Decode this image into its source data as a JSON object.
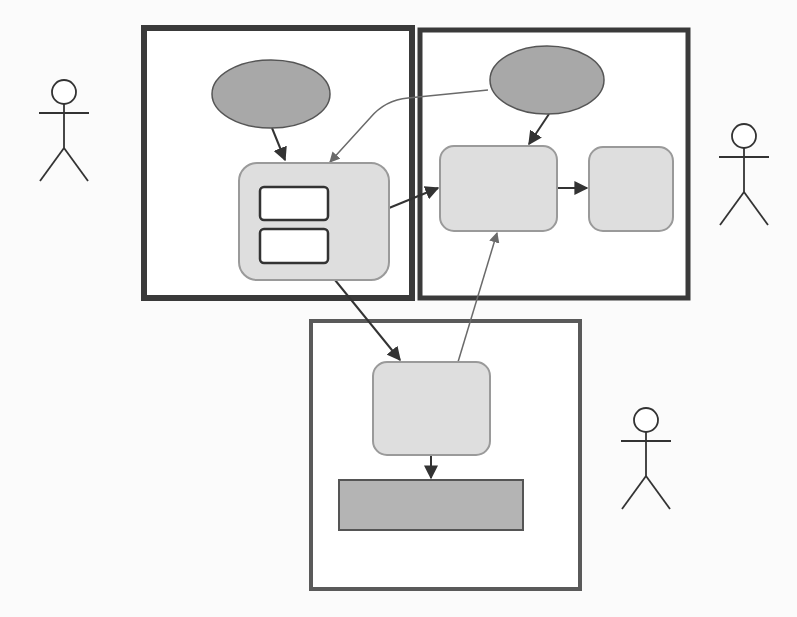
{
  "diagram": {
    "background": "#fbfbfb",
    "colors": {
      "frame": "#3a3a3a",
      "frame_light": "#5a5a5a",
      "ellipse_fill": "#a8a8a8",
      "ellipse_stroke": "#555555",
      "box_fill": "#dedede",
      "box_stroke": "#9a9a9a",
      "inner_fill": "#ffffff",
      "inner_stroke": "#333333",
      "bar_fill": "#b4b4b4",
      "bar_stroke": "#555555",
      "edge": "#333333",
      "edge_light": "#6a6a6a",
      "actor": "#333333"
    },
    "frames": [
      {
        "id": "frame-left",
        "x": 144,
        "y": 28,
        "w": 268,
        "h": 270,
        "sw": 6
      },
      {
        "id": "frame-right",
        "x": 420,
        "y": 30,
        "w": 268,
        "h": 268,
        "sw": 5
      },
      {
        "id": "frame-bottom",
        "x": 311,
        "y": 321,
        "w": 269,
        "h": 268,
        "sw": 4
      }
    ],
    "ellipses": [
      {
        "id": "ellipse-left",
        "cx": 271,
        "cy": 94,
        "rx": 59,
        "ry": 34
      },
      {
        "id": "ellipse-right",
        "cx": 547,
        "cy": 80,
        "rx": 57,
        "ry": 34
      }
    ],
    "boxes": [
      {
        "id": "box-left-container",
        "x": 239,
        "y": 163,
        "w": 150,
        "h": 117,
        "r": 18
      },
      {
        "id": "box-right-main",
        "x": 440,
        "y": 146,
        "w": 117,
        "h": 85,
        "r": 14
      },
      {
        "id": "box-right-side",
        "x": 589,
        "y": 147,
        "w": 84,
        "h": 84,
        "r": 14
      },
      {
        "id": "box-bottom-main",
        "x": 373,
        "y": 362,
        "w": 117,
        "h": 93,
        "r": 14
      }
    ],
    "inner_boxes": [
      {
        "id": "inner-box-top",
        "x": 260,
        "y": 187,
        "w": 68,
        "h": 33,
        "r": 4
      },
      {
        "id": "inner-box-bottom",
        "x": 260,
        "y": 229,
        "w": 68,
        "h": 34,
        "r": 4
      }
    ],
    "bars": [
      {
        "id": "bottom-bar",
        "x": 339,
        "y": 480,
        "w": 184,
        "h": 50
      }
    ],
    "edges": [
      {
        "id": "edge-left-ellipse-to-container",
        "d": "M 272 128 L 285 160",
        "arrow": true,
        "light": false
      },
      {
        "id": "edge-right-ellipse-to-container",
        "d": "M 488 90 L 408 98 Q 385 100 370 118 L 330 162",
        "arrow": true,
        "light": true
      },
      {
        "id": "edge-right-ellipse-to-main",
        "d": "M 549 114 L 529 144",
        "arrow": true,
        "light": false
      },
      {
        "id": "edge-container-to-right-main",
        "d": "M 389 208 L 438 188",
        "arrow": true,
        "light": false
      },
      {
        "id": "edge-right-main-to-side",
        "d": "M 557 188 L 587 188",
        "arrow": true,
        "light": false
      },
      {
        "id": "edge-container-to-bottom",
        "d": "M 335 280 L 400 360",
        "arrow": true,
        "light": false
      },
      {
        "id": "edge-bottom-to-right-main",
        "d": "M 458 362 L 497 233",
        "arrow": true,
        "light": true
      },
      {
        "id": "edge-bottom-main-to-bar",
        "d": "M 431 455 L 431 478",
        "arrow": true,
        "light": false
      }
    ],
    "actors": [
      {
        "id": "actor-left",
        "x": 64,
        "y": 80
      },
      {
        "id": "actor-right",
        "x": 744,
        "y": 124
      },
      {
        "id": "actor-bottom",
        "x": 646,
        "y": 408
      }
    ]
  }
}
